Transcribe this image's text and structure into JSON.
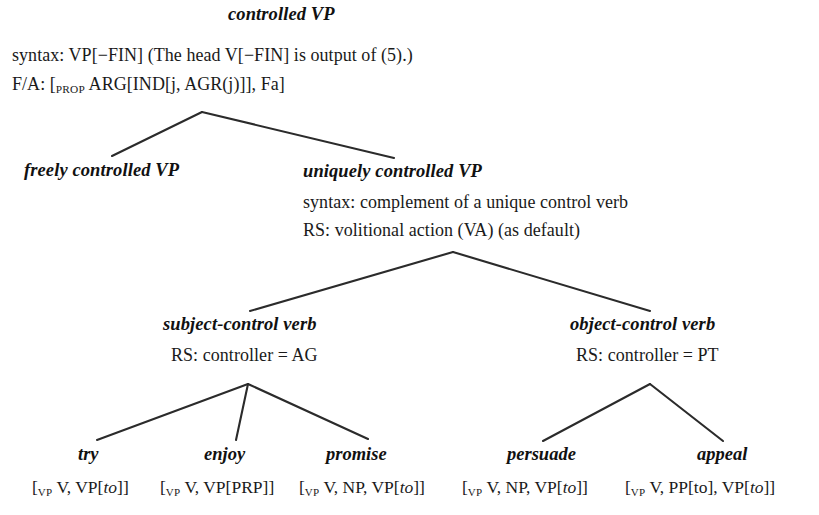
{
  "diagram": {
    "title_clipped": "",
    "root": {
      "label": "controlled VP",
      "syntax": "syntax: VP[−FIN]   (The head V[−FIN] is output of (5).)",
      "fa_prefix": "F/A: [",
      "fa_subscript": "PROP",
      "fa_rest": " ARG[IND[j, AGR(j)]], Fa]"
    },
    "level2": {
      "left": {
        "label": "freely controlled VP"
      },
      "right": {
        "label": "uniquely controlled VP",
        "syntax": "syntax: complement of a unique control verb",
        "rs": "RS: volitional action (VA) (as default)"
      }
    },
    "level3": {
      "left": {
        "label": "subject-control verb",
        "rs": "RS: controller = AG"
      },
      "right": {
        "label": "object-control verb",
        "rs": "RS: controller = PT"
      }
    },
    "leaves": [
      {
        "label": "try",
        "bracket_prefix": "[",
        "bracket_subscript": "VP",
        "bracket_mid": " V, VP[",
        "bracket_italic": "to",
        "bracket_suffix": "]]"
      },
      {
        "label": "enjoy",
        "bracket_prefix": "[",
        "bracket_subscript": "VP",
        "bracket_mid": " V, VP[PRP]]",
        "bracket_italic": "",
        "bracket_suffix": ""
      },
      {
        "label": "promise",
        "bracket_prefix": "[",
        "bracket_subscript": "VP",
        "bracket_mid": " V, NP, VP[",
        "bracket_italic": "to",
        "bracket_suffix": "]]"
      },
      {
        "label": "persuade",
        "bracket_prefix": "[",
        "bracket_subscript": "VP",
        "bracket_mid": " V, NP, VP[",
        "bracket_italic": "to",
        "bracket_suffix": "]]"
      },
      {
        "label": "appeal",
        "bracket_prefix": "[",
        "bracket_subscript": "VP",
        "bracket_mid": " V, PP[to], VP[",
        "bracket_italic": "to",
        "bracket_suffix": "]]"
      }
    ],
    "line_color": "#2b2b2b"
  }
}
